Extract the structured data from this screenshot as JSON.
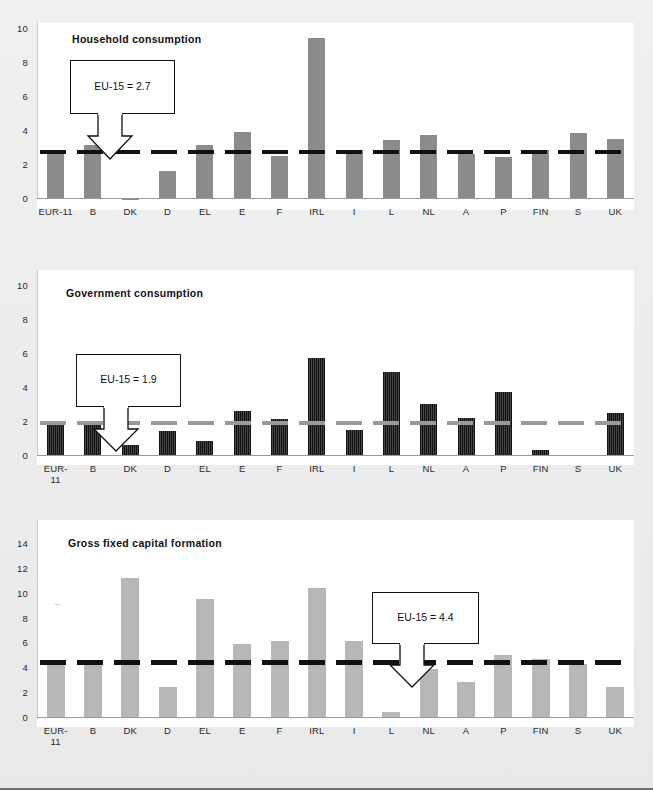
{
  "figure": {
    "background_color": "#ededed",
    "plot_background_color": "#ffffff"
  },
  "chart_data": [
    {
      "type": "bar",
      "title": "Household  consumption",
      "categories": [
        "EUR-11",
        "B",
        "DK",
        "D",
        "EL",
        "E",
        "F",
        "IRL",
        "I",
        "L",
        "NL",
        "A",
        "P",
        "FIN",
        "S",
        "UK"
      ],
      "category_lines": [
        [
          "EUR-11"
        ],
        [
          "B"
        ],
        [
          "DK"
        ],
        [
          "D"
        ],
        [
          "EL"
        ],
        [
          "E"
        ],
        [
          "F"
        ],
        [
          "IRL"
        ],
        [
          "I"
        ],
        [
          "L"
        ],
        [
          "NL"
        ],
        [
          "A"
        ],
        [
          "P"
        ],
        [
          "FIN"
        ],
        [
          "S"
        ],
        [
          "UK"
        ]
      ],
      "values": [
        2.6,
        3.1,
        -0.1,
        1.6,
        3.1,
        3.9,
        2.5,
        9.4,
        2.8,
        3.4,
        3.7,
        2.6,
        2.4,
        2.8,
        3.8,
        3.5
      ],
      "ylim": [
        0,
        10
      ],
      "yticks": [
        0,
        2,
        4,
        6,
        8,
        10
      ],
      "ytick_labels": [
        "0",
        "2",
        "4",
        "6",
        "8",
        "10"
      ],
      "xlabel": "",
      "ylabel": "",
      "grid": false,
      "legend": false,
      "bar_color": "#8b8b8b",
      "reference_line": {
        "label": "EU-15 = 2.7",
        "value": 2.7,
        "style": "dashed",
        "color": "#111111"
      },
      "annotation": "EU-15 = 2.7"
    },
    {
      "type": "bar",
      "title": "Government consumption",
      "categories": [
        "EUR-11",
        "B",
        "DK",
        "D",
        "EL",
        "E",
        "F",
        "IRL",
        "I",
        "L",
        "NL",
        "A",
        "P",
        "FIN",
        "S",
        "UK"
      ],
      "category_lines": [
        [
          "EUR-",
          "11"
        ],
        [
          "B"
        ],
        [
          "DK"
        ],
        [
          "D"
        ],
        [
          "EL"
        ],
        [
          "E"
        ],
        [
          "F"
        ],
        [
          "IRL"
        ],
        [
          "I"
        ],
        [
          "L"
        ],
        [
          "NL"
        ],
        [
          "A"
        ],
        [
          "P"
        ],
        [
          "FIN"
        ],
        [
          "S"
        ],
        [
          "UK"
        ]
      ],
      "values": [
        2.0,
        1.9,
        0.6,
        1.4,
        0.8,
        2.6,
        2.1,
        5.7,
        1.5,
        4.9,
        3.0,
        2.2,
        3.7,
        0.3,
        0.0,
        2.5
      ],
      "ylim": [
        0,
        10
      ],
      "yticks": [
        0,
        2,
        4,
        6,
        8,
        10
      ],
      "ytick_labels": [
        "0",
        "2",
        "4",
        "6",
        "8",
        "10"
      ],
      "xlabel": "",
      "ylabel": "",
      "grid": false,
      "legend": false,
      "bar_color": "#1f1f1f",
      "reference_line": {
        "label": "EU-15 = 1.9",
        "value": 1.9,
        "style": "dashed",
        "color": "#9a9a9a"
      },
      "annotation": "EU-15 = 1.9"
    },
    {
      "type": "bar",
      "title": "Gross fixed capital formation",
      "categories": [
        "EUR-11",
        "B",
        "DK",
        "D",
        "EL",
        "E",
        "F",
        "IRL",
        "I",
        "L",
        "NL",
        "A",
        "P",
        "FIN",
        "S",
        "UK"
      ],
      "category_lines": [
        [
          "EUR-",
          "11"
        ],
        [
          "B"
        ],
        [
          "DK"
        ],
        [
          "D"
        ],
        [
          "EL"
        ],
        [
          "E"
        ],
        [
          "F"
        ],
        [
          "IRL"
        ],
        [
          "I"
        ],
        [
          "L"
        ],
        [
          "NL"
        ],
        [
          "A"
        ],
        [
          "P"
        ],
        [
          "FIN"
        ],
        [
          "S"
        ],
        [
          "UK"
        ]
      ],
      "values": [
        4.4,
        4.5,
        11.2,
        2.4,
        9.5,
        5.9,
        6.1,
        10.4,
        6.1,
        0.4,
        3.9,
        2.8,
        5.0,
        4.7,
        4.3,
        2.4
      ],
      "ylim": [
        0,
        14
      ],
      "yticks": [
        0,
        2,
        4,
        6,
        8,
        10,
        12,
        14
      ],
      "ytick_labels": [
        "0",
        "2",
        "4",
        "6",
        "8",
        "10",
        "12",
        "14"
      ],
      "xlabel": "",
      "ylabel": "",
      "grid": false,
      "legend": false,
      "bar_color": "#b7b7b7",
      "reference_line": {
        "label": "EU-15 = 4.4",
        "value": 4.4,
        "style": "dashed",
        "color": "#111111"
      },
      "annotation": "EU-15 = 4.4"
    }
  ]
}
